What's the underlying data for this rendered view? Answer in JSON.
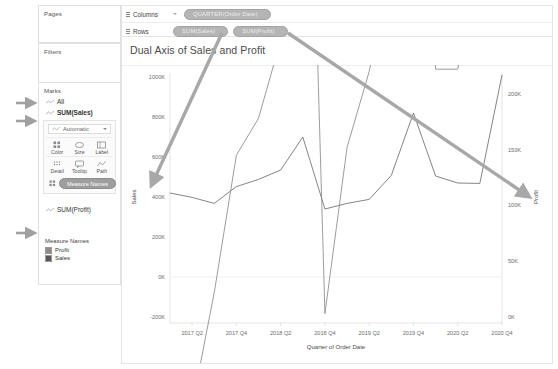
{
  "app": {
    "shelves": {
      "pages_label": "Pages",
      "filters_label": "Filters",
      "marks_label": "Marks",
      "columns_label": "Columns",
      "rows_label": "Rows",
      "columns_pills": [
        "QUARTER(Order Date)"
      ],
      "rows_pills": [
        "SUM(Sales)",
        "SUM(Profit)"
      ]
    },
    "marks_cards": [
      {
        "name": "All",
        "bold": false
      },
      {
        "name": "SUM(Sales)",
        "bold": true
      },
      {
        "name": "SUM(Profit)",
        "bold": false
      }
    ],
    "mark_type": "Automatic",
    "mark_buttons": [
      {
        "label": "Color",
        "icon": "color-icon"
      },
      {
        "label": "Size",
        "icon": "size-icon"
      },
      {
        "label": "Label",
        "icon": "label-icon"
      },
      {
        "label": "Detail",
        "icon": "detail-icon"
      },
      {
        "label": "Tooltip",
        "icon": "tooltip-icon"
      },
      {
        "label": "Path",
        "icon": "path-icon"
      }
    ],
    "marks_pill": "Measure Names",
    "legend": {
      "title": "Measure Names",
      "items": [
        {
          "label": "Profit",
          "color": "#8c8c8c"
        },
        {
          "label": "Sales",
          "color": "#5a5a5a"
        }
      ]
    },
    "colors": {
      "pill_gray": "#9e9e9e",
      "shelf_pill": "#b5b5b5",
      "annotation_arrow": "#a8a8a8",
      "panel_border": "#e4e4e4"
    },
    "annotations": [
      {
        "name": "arrow-to-all-card",
        "target": "All"
      },
      {
        "name": "arrow-to-sum-sales-card",
        "target": "SUM(Sales)"
      },
      {
        "name": "arrow-to-sum-profit-card",
        "target": "SUM(Profit)"
      },
      {
        "name": "arrow-sales-pill-to-sales-axis",
        "from": "SUM(Sales)",
        "to": "Sales axis"
      },
      {
        "name": "arrow-profit-pill-to-profit-axis",
        "from": "SUM(Profit)",
        "to": "Profit axis"
      }
    ]
  },
  "chart_data": {
    "type": "line",
    "title": "Dual Axis of Sales and Profit",
    "xlabel": "Quarter of Order Date",
    "grid": false,
    "legend_position": "left-panel",
    "x": [
      "2017 Q1",
      "2017 Q2",
      "2017 Q3",
      "2017 Q4",
      "2018 Q1",
      "2018 Q2",
      "2018 Q3",
      "2018 Q4",
      "2019 Q1",
      "2019 Q2",
      "2019 Q3",
      "2019 Q4",
      "2020 Q1",
      "2020 Q2",
      "2020 Q3",
      "2020 Q4"
    ],
    "xticks": [
      "2017 Q2",
      "2017 Q4",
      "2018 Q2",
      "2018 Q4",
      "2019 Q2",
      "2019 Q4",
      "2020 Q2",
      "2020 Q4"
    ],
    "axes": [
      {
        "name": "Sales",
        "side": "left",
        "ylabel": "Sales",
        "ylim": [
          -200000,
          1000000
        ],
        "yticks": [
          -200000,
          0,
          200000,
          400000,
          600000,
          800000,
          1000000
        ],
        "yticklabels": [
          "-200K",
          "0K",
          "200K",
          "400K",
          "600K",
          "800K",
          "1000K"
        ]
      },
      {
        "name": "Profit",
        "side": "right",
        "ylabel": "Profit",
        "ylim": [
          0,
          215000
        ],
        "yticks": [
          0,
          50000,
          100000,
          150000,
          200000
        ],
        "yticklabels": [
          "0K",
          "50K",
          "100K",
          "150K",
          "200K"
        ]
      }
    ],
    "series": [
      {
        "name": "Sales",
        "axis": "Sales",
        "color": "#6e6e6e",
        "values": [
          420000,
          398000,
          368000,
          452000,
          488000,
          535000,
          700000,
          340000,
          368000,
          388000,
          508000,
          820000,
          505000,
          470000,
          468000,
          1010000
        ]
      },
      {
        "name": "Profit",
        "axis": "Profit",
        "color": "#8a8a8a",
        "values": [
          -195000,
          -80000,
          22000,
          145000,
          178000,
          248000,
          695000,
          3000,
          152000,
          220000,
          312000,
          880000,
          222000,
          222000,
          322000,
          975000
        ]
      }
    ]
  }
}
